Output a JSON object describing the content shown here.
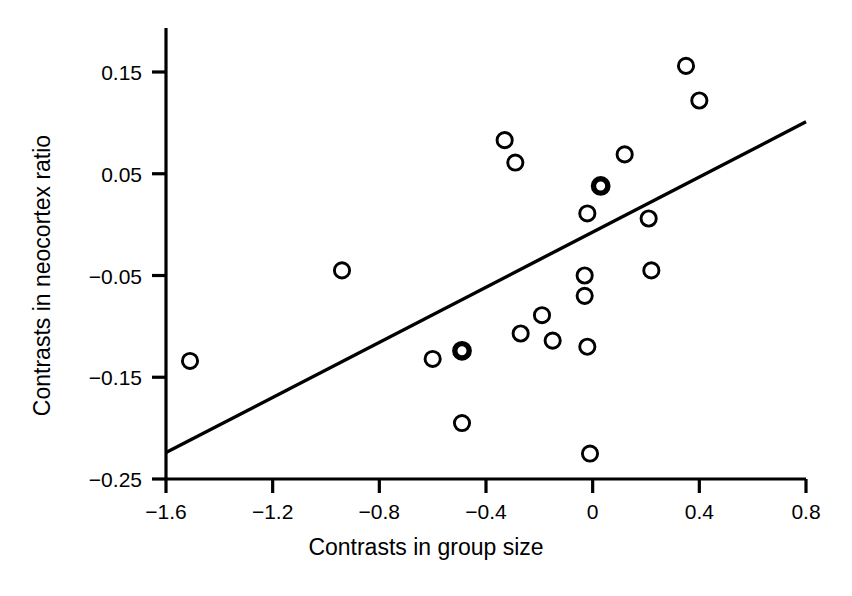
{
  "chart_data": {
    "type": "scatter",
    "title": "",
    "xlabel": "Contrasts in group size",
    "ylabel": "Contrasts in neocortex ratio",
    "xlim": [
      -1.6,
      0.8
    ],
    "ylim": [
      -0.25,
      0.19
    ],
    "grid": false,
    "legend": "none",
    "xticks": [
      -1.6,
      -1.2,
      -0.8,
      -0.4,
      0,
      0.4,
      0.8
    ],
    "xticklabels": [
      "-1.6",
      "-1.2",
      "-0.8",
      "-0.4",
      "0",
      "0.4",
      "0.8"
    ],
    "yticks": [
      0.15,
      0.05,
      -0.05,
      -0.15,
      -0.25
    ],
    "yticklabels": [
      "0.15",
      "0.05",
      "-0.05",
      "-0.15",
      "-0.25"
    ],
    "marker": "open-circle",
    "marker_color": "#000000",
    "points": [
      {
        "x": -1.51,
        "y": -0.134,
        "emphasis": false
      },
      {
        "x": -0.94,
        "y": -0.045,
        "emphasis": false
      },
      {
        "x": -0.6,
        "y": -0.132,
        "emphasis": false
      },
      {
        "x": -0.49,
        "y": -0.124,
        "emphasis": true
      },
      {
        "x": -0.49,
        "y": -0.195,
        "emphasis": false
      },
      {
        "x": -0.33,
        "y": 0.083,
        "emphasis": false
      },
      {
        "x": -0.29,
        "y": 0.061,
        "emphasis": false
      },
      {
        "x": -0.27,
        "y": -0.107,
        "emphasis": false
      },
      {
        "x": -0.19,
        "y": -0.089,
        "emphasis": false
      },
      {
        "x": -0.15,
        "y": -0.114,
        "emphasis": false
      },
      {
        "x": -0.03,
        "y": -0.05,
        "emphasis": false
      },
      {
        "x": -0.03,
        "y": -0.07,
        "emphasis": false
      },
      {
        "x": -0.02,
        "y": 0.011,
        "emphasis": false
      },
      {
        "x": -0.02,
        "y": -0.12,
        "emphasis": false
      },
      {
        "x": -0.01,
        "y": -0.225,
        "emphasis": false
      },
      {
        "x": 0.03,
        "y": 0.038,
        "emphasis": true
      },
      {
        "x": 0.12,
        "y": 0.069,
        "emphasis": false
      },
      {
        "x": 0.21,
        "y": 0.006,
        "emphasis": false
      },
      {
        "x": 0.22,
        "y": -0.045,
        "emphasis": false
      },
      {
        "x": 0.35,
        "y": 0.156,
        "emphasis": false
      },
      {
        "x": 0.4,
        "y": 0.122,
        "emphasis": false
      }
    ],
    "trendline": {
      "name": "regression line",
      "x0": -1.6,
      "y0": -0.224,
      "x1": 0.8,
      "y1": 0.101
    }
  }
}
